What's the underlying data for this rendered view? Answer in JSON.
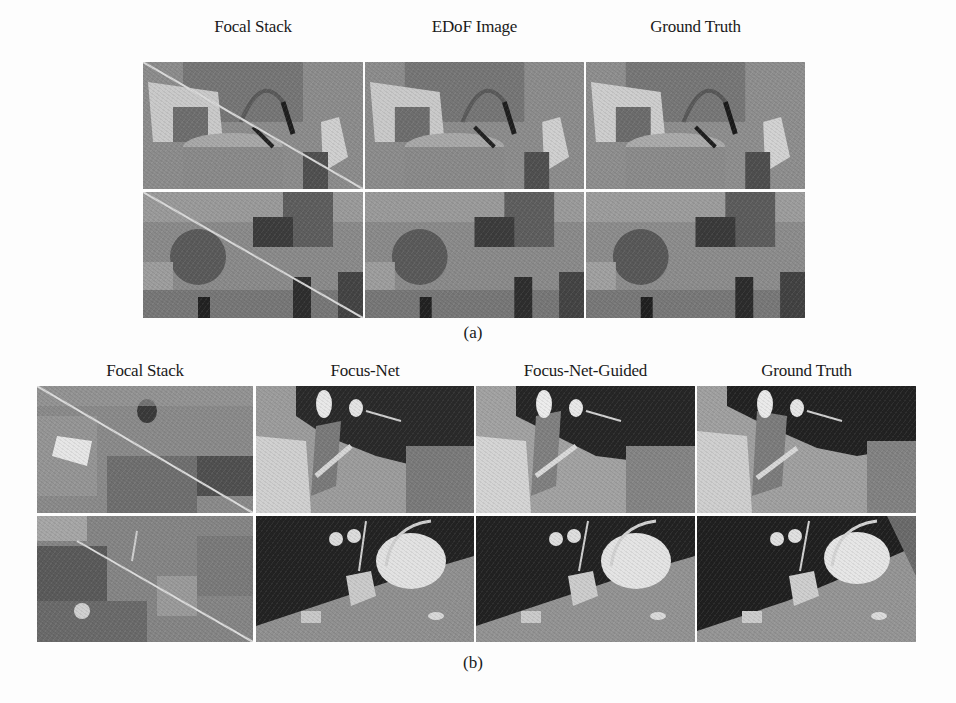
{
  "figure_a": {
    "column_headers": [
      "Focal Stack",
      "EDoF Image",
      "Ground Truth"
    ],
    "caption": "(a)",
    "rows": 2
  },
  "figure_b": {
    "column_headers": [
      "Focal Stack",
      "Focus-Net",
      "Focus-Net-Guided",
      "Ground Truth"
    ],
    "caption": "(b)",
    "rows": 2
  },
  "colors": {
    "background": "#fdfdfd",
    "image_gray_mid": "#8a8a8a",
    "depth_dark": "#2a2a2a",
    "depth_light": "#d8d8d8"
  }
}
